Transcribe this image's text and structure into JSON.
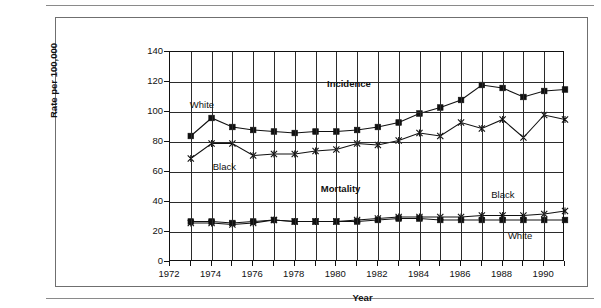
{
  "figure": {
    "top_rule": "divider-top",
    "bottom_rule": "divider-bottom"
  },
  "chart_data": {
    "type": "line",
    "title": "",
    "xlabel": "Year",
    "ylabel": "Rate per 100,000",
    "xlim": [
      1972,
      1991
    ],
    "ylim": [
      0,
      140
    ],
    "ytick_step": 20,
    "yticks": [
      0,
      20,
      40,
      60,
      80,
      100,
      120,
      140
    ],
    "xticks_labeled": [
      1972,
      1974,
      1976,
      1978,
      1980,
      1982,
      1984,
      1986,
      1988,
      1990
    ],
    "xticks_all": [
      1972,
      1973,
      1974,
      1975,
      1976,
      1977,
      1978,
      1979,
      1980,
      1981,
      1982,
      1983,
      1984,
      1985,
      1986,
      1987,
      1988,
      1989,
      1990,
      1991
    ],
    "grid": "both",
    "legend": "inline-annotations",
    "x": [
      1973,
      1974,
      1975,
      1976,
      1977,
      1978,
      1979,
      1980,
      1981,
      1982,
      1983,
      1984,
      1985,
      1986,
      1987,
      1988,
      1989,
      1990,
      1991
    ],
    "series": [
      {
        "name": "Incidence White",
        "marker": "filled-square",
        "values": [
          84,
          96,
          90,
          88,
          87,
          86,
          87,
          87,
          88,
          90,
          93,
          99,
          103,
          108,
          118,
          116,
          110,
          114,
          115
        ]
      },
      {
        "name": "Incidence Black",
        "marker": "x",
        "values": [
          69,
          79,
          79,
          71,
          72,
          72,
          74,
          75,
          79,
          78,
          81,
          86,
          84,
          93,
          89,
          95,
          83,
          98,
          95
        ]
      },
      {
        "name": "Mortality White",
        "marker": "filled-square",
        "values": [
          27,
          27,
          26,
          27,
          28,
          27,
          27,
          27,
          27,
          28,
          29,
          29,
          28,
          28,
          28,
          28,
          28,
          28,
          28
        ]
      },
      {
        "name": "Mortality Black",
        "marker": "x",
        "values": [
          26,
          26,
          25,
          26,
          28,
          27,
          27,
          27,
          28,
          29,
          30,
          30,
          30,
          30,
          31,
          31,
          31,
          32,
          34
        ]
      }
    ],
    "annotations": [
      {
        "text": "Incidence",
        "bold": true,
        "x": 1979.6,
        "y": 118
      },
      {
        "text": "Mortality",
        "bold": true,
        "x": 1979.3,
        "y": 48
      },
      {
        "text": "White",
        "bold": false,
        "x": 1973.0,
        "y": 104
      },
      {
        "text": "Black",
        "bold": false,
        "x": 1974.1,
        "y": 63
      },
      {
        "text": "Black",
        "bold": false,
        "x": 1987.5,
        "y": 44
      },
      {
        "text": "White",
        "bold": false,
        "x": 1988.3,
        "y": 17
      }
    ]
  },
  "colors": {
    "ink": "#111111",
    "grid": "#2b2b2b",
    "frame": "#6f6f6f",
    "rule": "#8a8a8a",
    "background": "#ffffff"
  }
}
